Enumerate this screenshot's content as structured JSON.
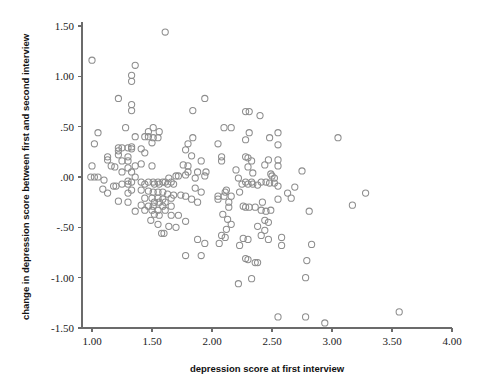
{
  "chart_data": {
    "type": "scatter",
    "title": "",
    "subtitle": "",
    "xlabel": "depression score at first interview",
    "ylabel": "change in depression score between first and second interview",
    "xlim": [
      0.75,
      4.0
    ],
    "ylim": [
      -1.5,
      1.5
    ],
    "xticks": [
      1.0,
      1.5,
      2.0,
      2.5,
      3.0,
      3.5,
      4.0
    ],
    "xtick_labels": [
      "1.00",
      "1.50",
      "2.00",
      "2.50",
      "3.00",
      "3.50",
      "4.00"
    ],
    "yticks": [
      1.5,
      1.0,
      0.5,
      0.0,
      -0.5,
      -1.0,
      -1.5
    ],
    "ytick_labels": [
      "1.50",
      "1.00",
      ".50",
      ".00",
      "-.50",
      "-1.00",
      "-1.50"
    ],
    "grid": false,
    "legend": null,
    "marker": {
      "shape": "open-circle",
      "radius_px": 3.1,
      "stroke_color": "#8d8d8d",
      "fill": "none",
      "stroke_width_px": 1.05
    },
    "axis_color": "#6b6b6b",
    "background_color": "#ffffff",
    "n_points": 233,
    "annotations": [],
    "points": [
      [
        1.0,
        1.16
      ],
      [
        1.61,
        1.44
      ],
      [
        1.36,
        1.11
      ],
      [
        1.33,
        1.01
      ],
      [
        1.33,
        0.95
      ],
      [
        1.22,
        0.78
      ],
      [
        1.94,
        0.78
      ],
      [
        1.33,
        0.72
      ],
      [
        1.33,
        0.66
      ],
      [
        1.84,
        0.66
      ],
      [
        2.28,
        0.65
      ],
      [
        2.31,
        0.65
      ],
      [
        2.4,
        0.61
      ],
      [
        1.28,
        0.49
      ],
      [
        1.51,
        0.49
      ],
      [
        2.1,
        0.49
      ],
      [
        2.16,
        0.49
      ],
      [
        1.05,
        0.44
      ],
      [
        1.47,
        0.45
      ],
      [
        1.56,
        0.45
      ],
      [
        2.55,
        0.44
      ],
      [
        2.31,
        0.44
      ],
      [
        1.36,
        0.4
      ],
      [
        1.44,
        0.4
      ],
      [
        1.47,
        0.4
      ],
      [
        1.51,
        0.39
      ],
      [
        1.84,
        0.39
      ],
      [
        1.55,
        0.39
      ],
      [
        2.48,
        0.39
      ],
      [
        3.05,
        0.39
      ],
      [
        2.28,
        0.37
      ],
      [
        1.5,
        0.34
      ],
      [
        1.02,
        0.33
      ],
      [
        1.8,
        0.33
      ],
      [
        2.05,
        0.33
      ],
      [
        2.55,
        0.32
      ],
      [
        1.33,
        0.3
      ],
      [
        1.22,
        0.29
      ],
      [
        1.25,
        0.29
      ],
      [
        1.3,
        0.29
      ],
      [
        1.41,
        0.28
      ],
      [
        1.33,
        0.28
      ],
      [
        1.22,
        0.26
      ],
      [
        1.78,
        0.27
      ],
      [
        1.44,
        0.24
      ],
      [
        1.22,
        0.22
      ],
      [
        1.13,
        0.2
      ],
      [
        1.3,
        0.2
      ],
      [
        1.83,
        0.21
      ],
      [
        2.28,
        0.2
      ],
      [
        2.08,
        0.2
      ],
      [
        2.3,
        0.19
      ],
      [
        1.13,
        0.17
      ],
      [
        1.25,
        0.16
      ],
      [
        1.3,
        0.16
      ],
      [
        1.91,
        0.16
      ],
      [
        2.08,
        0.16
      ],
      [
        2.33,
        0.16
      ],
      [
        2.47,
        0.17
      ],
      [
        2.55,
        0.17
      ],
      [
        1.41,
        0.13
      ],
      [
        1.76,
        0.12
      ],
      [
        1.16,
        0.11
      ],
      [
        1.0,
        0.11
      ],
      [
        1.36,
        0.11
      ],
      [
        1.5,
        0.11
      ],
      [
        1.8,
        0.11
      ],
      [
        2.44,
        0.12
      ],
      [
        2.55,
        0.11
      ],
      [
        2.3,
        0.1
      ],
      [
        1.19,
        0.1
      ],
      [
        1.3,
        0.09
      ],
      [
        2.2,
        0.07
      ],
      [
        2.75,
        0.06
      ],
      [
        1.25,
        0.05
      ],
      [
        1.33,
        0.05
      ],
      [
        1.8,
        0.05
      ],
      [
        1.88,
        0.05
      ],
      [
        1.95,
        0.05
      ],
      [
        2.34,
        0.04
      ],
      [
        2.49,
        0.03
      ],
      [
        1.78,
        0.02
      ],
      [
        1.7,
        0.01
      ],
      [
        1.72,
        0.01
      ],
      [
        1.94,
        0.01
      ],
      [
        2.5,
        0.01
      ],
      [
        0.99,
        0.0
      ],
      [
        1.02,
        0.0
      ],
      [
        1.05,
        0.0
      ],
      [
        1.36,
        0.0
      ],
      [
        1.64,
        -0.01
      ],
      [
        1.86,
        -0.01
      ],
      [
        2.22,
        -0.01
      ],
      [
        2.52,
        -0.01
      ],
      [
        1.1,
        -0.03
      ],
      [
        1.3,
        -0.04
      ],
      [
        1.33,
        -0.05
      ],
      [
        1.41,
        -0.05
      ],
      [
        1.47,
        -0.05
      ],
      [
        1.51,
        -0.05
      ],
      [
        1.55,
        -0.05
      ],
      [
        1.59,
        -0.05
      ],
      [
        1.61,
        -0.05
      ],
      [
        1.66,
        -0.05
      ],
      [
        2.28,
        -0.05
      ],
      [
        2.33,
        -0.05
      ],
      [
        2.41,
        -0.05
      ],
      [
        2.45,
        -0.05
      ],
      [
        2.48,
        -0.06
      ],
      [
        2.52,
        -0.06
      ],
      [
        1.25,
        -0.07
      ],
      [
        1.3,
        -0.07
      ],
      [
        1.44,
        -0.07
      ],
      [
        1.52,
        -0.07
      ],
      [
        1.56,
        -0.07
      ],
      [
        1.63,
        -0.07
      ],
      [
        1.68,
        -0.07
      ],
      [
        2.25,
        -0.07
      ],
      [
        2.3,
        -0.07
      ],
      [
        2.34,
        -0.07
      ],
      [
        2.38,
        -0.08
      ],
      [
        2.55,
        -0.09
      ],
      [
        1.18,
        -0.09
      ],
      [
        1.2,
        -0.09
      ],
      [
        2.69,
        -0.1
      ],
      [
        1.09,
        -0.12
      ],
      [
        1.33,
        -0.13
      ],
      [
        1.41,
        -0.13
      ],
      [
        1.86,
        -0.11
      ],
      [
        2.12,
        -0.13
      ],
      [
        1.47,
        -0.14
      ],
      [
        1.51,
        -0.15
      ],
      [
        1.55,
        -0.15
      ],
      [
        1.59,
        -0.15
      ],
      [
        1.91,
        -0.15
      ],
      [
        2.11,
        -0.15
      ],
      [
        2.23,
        -0.15
      ],
      [
        1.13,
        -0.16
      ],
      [
        1.3,
        -0.16
      ],
      [
        1.63,
        -0.17
      ],
      [
        1.68,
        -0.18
      ],
      [
        1.74,
        -0.18
      ],
      [
        1.78,
        -0.19
      ],
      [
        2.05,
        -0.19
      ],
      [
        2.1,
        -0.19
      ],
      [
        2.16,
        -0.19
      ],
      [
        2.63,
        -0.16
      ],
      [
        3.28,
        -0.16
      ],
      [
        1.44,
        -0.21
      ],
      [
        1.5,
        -0.21
      ],
      [
        1.55,
        -0.21
      ],
      [
        1.59,
        -0.22
      ],
      [
        1.66,
        -0.21
      ],
      [
        1.83,
        -0.22
      ],
      [
        2.05,
        -0.22
      ],
      [
        2.55,
        -0.22
      ],
      [
        2.66,
        -0.21
      ],
      [
        1.22,
        -0.24
      ],
      [
        1.3,
        -0.25
      ],
      [
        1.52,
        -0.25
      ],
      [
        1.56,
        -0.25
      ],
      [
        1.61,
        -0.25
      ],
      [
        1.88,
        -0.25
      ],
      [
        2.14,
        -0.25
      ],
      [
        2.42,
        -0.25
      ],
      [
        1.41,
        -0.28
      ],
      [
        1.47,
        -0.29
      ],
      [
        1.51,
        -0.29
      ],
      [
        1.59,
        -0.29
      ],
      [
        1.66,
        -0.29
      ],
      [
        2.26,
        -0.29
      ],
      [
        2.28,
        -0.3
      ],
      [
        2.31,
        -0.3
      ],
      [
        2.36,
        -0.3
      ],
      [
        2.14,
        -0.3
      ],
      [
        3.17,
        -0.28
      ],
      [
        1.36,
        -0.34
      ],
      [
        1.44,
        -0.33
      ],
      [
        1.5,
        -0.33
      ],
      [
        1.55,
        -0.33
      ],
      [
        1.61,
        -0.33
      ],
      [
        2.41,
        -0.33
      ],
      [
        2.45,
        -0.34
      ],
      [
        2.49,
        -0.33
      ],
      [
        2.81,
        -0.34
      ],
      [
        1.52,
        -0.37
      ],
      [
        1.56,
        -0.38
      ],
      [
        1.66,
        -0.38
      ],
      [
        1.72,
        -0.38
      ],
      [
        2.09,
        -0.37
      ],
      [
        1.49,
        -0.43
      ],
      [
        1.78,
        -0.44
      ],
      [
        2.13,
        -0.42
      ],
      [
        2.44,
        -0.43
      ],
      [
        2.47,
        -0.45
      ],
      [
        1.55,
        -0.47
      ],
      [
        1.64,
        -0.49
      ],
      [
        1.7,
        -0.5
      ],
      [
        2.16,
        -0.47
      ],
      [
        2.38,
        -0.49
      ],
      [
        2.12,
        -0.52
      ],
      [
        2.44,
        -0.53
      ],
      [
        1.58,
        -0.56
      ],
      [
        1.6,
        -0.56
      ],
      [
        2.08,
        -0.58
      ],
      [
        2.41,
        -0.58
      ],
      [
        1.88,
        -0.62
      ],
      [
        2.11,
        -0.6
      ],
      [
        2.26,
        -0.61
      ],
      [
        2.3,
        -0.62
      ],
      [
        2.47,
        -0.62
      ],
      [
        2.58,
        -0.6
      ],
      [
        1.94,
        -0.66
      ],
      [
        2.06,
        -0.66
      ],
      [
        2.23,
        -0.68
      ],
      [
        2.58,
        -0.68
      ],
      [
        2.83,
        -0.67
      ],
      [
        1.78,
        -0.78
      ],
      [
        1.91,
        -0.78
      ],
      [
        2.28,
        -0.81
      ],
      [
        2.3,
        -0.82
      ],
      [
        2.79,
        -0.83
      ],
      [
        2.36,
        -0.85
      ],
      [
        2.38,
        -0.85
      ],
      [
        2.22,
        -1.06
      ],
      [
        2.33,
        -1.01
      ],
      [
        2.78,
        -1.0
      ],
      [
        2.55,
        -1.39
      ],
      [
        2.78,
        -1.39
      ],
      [
        2.94,
        -1.45
      ],
      [
        3.56,
        -1.34
      ]
    ]
  }
}
